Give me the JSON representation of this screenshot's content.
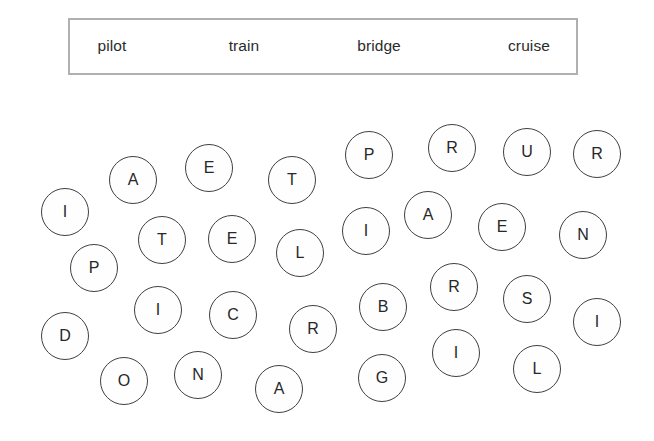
{
  "canvas": {
    "width": 654,
    "height": 441,
    "background": "#ffffff"
  },
  "word_bank": {
    "box": {
      "x": 68,
      "y": 18,
      "width": 510,
      "height": 57,
      "border_color": "#b0b0b0",
      "border_width": 2.5,
      "background": "#ffffff"
    },
    "words": [
      {
        "label": "pilot",
        "x": 112,
        "y": 46
      },
      {
        "label": "train",
        "x": 244,
        "y": 46
      },
      {
        "label": "bridge",
        "x": 379,
        "y": 46
      },
      {
        "label": "cruise",
        "x": 529,
        "y": 46
      }
    ]
  },
  "grid": {
    "circle_stroke": "#3f4042",
    "letter_color": "#27282a",
    "circles": [
      {
        "letter": "I",
        "x": 65,
        "y": 212,
        "r": 24
      },
      {
        "letter": "A",
        "x": 133,
        "y": 180,
        "r": 24
      },
      {
        "letter": "E",
        "x": 209,
        "y": 168,
        "r": 24
      },
      {
        "letter": "T",
        "x": 292,
        "y": 180,
        "r": 24
      },
      {
        "letter": "P",
        "x": 369,
        "y": 155,
        "r": 24
      },
      {
        "letter": "R",
        "x": 452,
        "y": 148,
        "r": 24
      },
      {
        "letter": "U",
        "x": 527,
        "y": 152,
        "r": 24
      },
      {
        "letter": "R",
        "x": 597,
        "y": 154,
        "r": 24
      },
      {
        "letter": "T",
        "x": 162,
        "y": 240,
        "r": 24
      },
      {
        "letter": "E",
        "x": 232,
        "y": 239,
        "r": 24
      },
      {
        "letter": "L",
        "x": 300,
        "y": 253,
        "r": 24
      },
      {
        "letter": "I",
        "x": 366,
        "y": 231,
        "r": 24
      },
      {
        "letter": "A",
        "x": 428,
        "y": 215,
        "r": 24
      },
      {
        "letter": "E",
        "x": 502,
        "y": 227,
        "r": 24
      },
      {
        "letter": "N",
        "x": 583,
        "y": 235,
        "r": 24
      },
      {
        "letter": "P",
        "x": 94,
        "y": 268,
        "r": 24
      },
      {
        "letter": "I",
        "x": 158,
        "y": 310,
        "r": 24
      },
      {
        "letter": "C",
        "x": 233,
        "y": 315,
        "r": 24
      },
      {
        "letter": "R",
        "x": 313,
        "y": 329,
        "r": 24
      },
      {
        "letter": "B",
        "x": 383,
        "y": 307,
        "r": 24
      },
      {
        "letter": "R",
        "x": 454,
        "y": 287,
        "r": 24
      },
      {
        "letter": "S",
        "x": 527,
        "y": 299,
        "r": 24
      },
      {
        "letter": "I",
        "x": 597,
        "y": 322,
        "r": 24
      },
      {
        "letter": "D",
        "x": 65,
        "y": 336,
        "r": 24
      },
      {
        "letter": "O",
        "x": 124,
        "y": 381,
        "r": 24
      },
      {
        "letter": "N",
        "x": 198,
        "y": 375,
        "r": 24
      },
      {
        "letter": "A",
        "x": 279,
        "y": 389,
        "r": 24
      },
      {
        "letter": "G",
        "x": 382,
        "y": 378,
        "r": 24
      },
      {
        "letter": "I",
        "x": 456,
        "y": 353,
        "r": 24
      },
      {
        "letter": "L",
        "x": 537,
        "y": 369,
        "r": 24
      }
    ]
  }
}
